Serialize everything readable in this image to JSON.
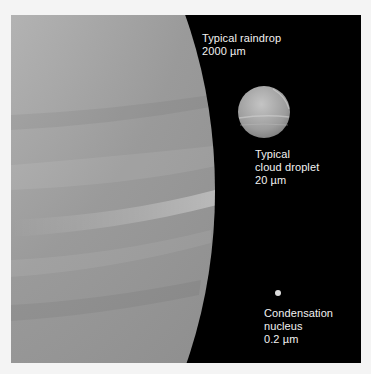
{
  "figure": {
    "background_color": "#000000",
    "frame_color": "#f4f4f4",
    "text_color": "#f2f2f2"
  },
  "objects": [
    {
      "id": "raindrop",
      "name": "Typical raindrop",
      "size": "2000 µm",
      "label_lines": [
        "Typical raindrop",
        "2000 µm"
      ]
    },
    {
      "id": "cloud_droplet",
      "name": "Typical cloud droplet",
      "size": "20 µm",
      "label_lines": [
        "Typical",
        "cloud droplet",
        "20 µm"
      ]
    },
    {
      "id": "condensation_nucleus",
      "name": "Condensation nucleus",
      "size": "0.2 µm",
      "label_lines": [
        "Condensation",
        "nucleus",
        "0.2 µm"
      ]
    }
  ]
}
